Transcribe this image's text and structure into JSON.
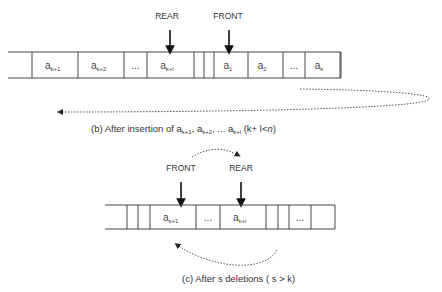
{
  "diagram_b": {
    "rear_label": "REAR",
    "front_label": "FRONT",
    "cells": [
      {
        "base": "",
        "sub": ""
      },
      {
        "base": "a",
        "sub": "k+1"
      },
      {
        "base": "a",
        "sub": "k+2"
      },
      {
        "base": "...",
        "sub": ""
      },
      {
        "base": "a",
        "sub": "k+l"
      },
      {
        "base": "",
        "sub": ""
      },
      {
        "base": "",
        "sub": ""
      },
      {
        "base": "a",
        "sub": "1"
      },
      {
        "base": "a",
        "sub": "2"
      },
      {
        "base": "...",
        "sub": ""
      },
      {
        "base": "a",
        "sub": "k"
      }
    ],
    "caption": {
      "prefix": "(b) After insertion of a",
      "s1": "k+1",
      "mid1": ", a",
      "s2": "k+2",
      "mid2": ", ... a",
      "s3": "k+l",
      "suffix_a": " (k+ l<",
      "suffix_n": "n",
      "suffix_b": ")"
    }
  },
  "diagram_c": {
    "front_label": "FRONT",
    "rear_label": "REAR",
    "cells": [
      {
        "base": "",
        "sub": ""
      },
      {
        "base": "",
        "sub": ""
      },
      {
        "base": "",
        "sub": ""
      },
      {
        "base": "a",
        "sub": "s+1"
      },
      {
        "base": "...",
        "sub": ""
      },
      {
        "base": "a",
        "sub": "k+l"
      },
      {
        "base": "",
        "sub": ""
      },
      {
        "base": "",
        "sub": ""
      },
      {
        "base": "...",
        "sub": ""
      },
      {
        "base": "",
        "sub": ""
      }
    ],
    "caption": "(c) After s deletions ( s > k)"
  }
}
